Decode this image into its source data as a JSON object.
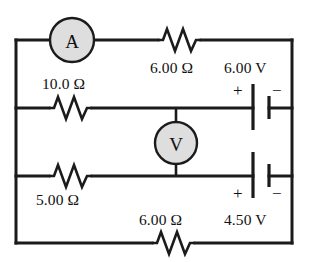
{
  "figure": {
    "background_color": "#ffffff",
    "wire_color": "#1b1b1b",
    "meter_fill_color": "#dedede"
  },
  "meters": [
    {
      "name": "ammeter",
      "symbol": "A",
      "branch": "top"
    },
    {
      "name": "voltmeter",
      "symbol": "V",
      "branch": "middle-bridge"
    }
  ],
  "resistors": [
    {
      "name": "top-right-resistor",
      "label": "6.00 Ω",
      "value": "6.00",
      "unit": "Ω",
      "branch": "top"
    },
    {
      "name": "middle-resistor",
      "label": "10.0 Ω",
      "value": "10.0",
      "unit": "Ω",
      "branch": "upper-middle"
    },
    {
      "name": "lower-middle-resistor",
      "label": "5.00 Ω",
      "value": "5.00",
      "unit": "Ω",
      "branch": "lower-middle"
    },
    {
      "name": "bottom-resistor",
      "label": "6.00 Ω",
      "value": "6.00",
      "unit": "Ω",
      "branch": "bottom"
    }
  ],
  "batteries": [
    {
      "name": "upper-battery",
      "label": "6.00 V",
      "value": "6.00",
      "unit": "V",
      "positive_sign": "+",
      "negative_sign": "−",
      "branch": "upper-middle-right"
    },
    {
      "name": "lower-battery",
      "label": "4.50 V",
      "value": "4.50",
      "unit": "V",
      "positive_sign": "+",
      "negative_sign": "−",
      "branch": "lower-middle-right"
    }
  ]
}
